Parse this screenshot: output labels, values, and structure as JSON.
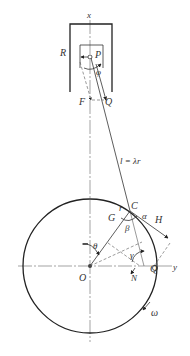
{
  "diagram": {
    "labels": {
      "x_axis": "x",
      "y_axis": "y",
      "R": "R",
      "P": "P",
      "phi": "φ",
      "F": "F",
      "Q_top": "Q",
      "rod_length": "l = λr",
      "C": "C",
      "r": "r",
      "G": "G",
      "alpha": "α",
      "H": "H",
      "beta": "β",
      "theta": "θ",
      "gamma": "γ",
      "O": "O",
      "N": "N",
      "Q_bottom": "Q",
      "omega": "ω"
    },
    "geometry": {
      "crank_center": [
        90,
        266
      ],
      "crank_radius": 67,
      "crank_pin_C": [
        130,
        211
      ],
      "piston_pin_P": [
        90,
        57
      ]
    },
    "colors": {
      "stroke": "#333333",
      "background": "#ffffff"
    }
  }
}
